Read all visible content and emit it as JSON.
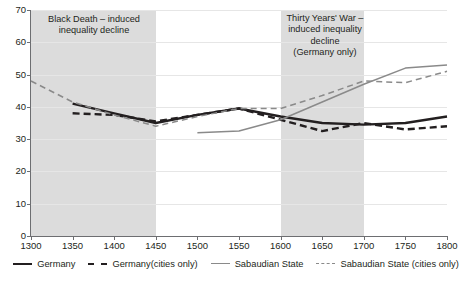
{
  "chart_data": {
    "type": "line",
    "title": "",
    "xlabel": "",
    "ylabel": "",
    "xlim": [
      1300,
      1800
    ],
    "ylim": [
      0,
      70
    ],
    "xticks": [
      1300,
      1350,
      1400,
      1450,
      1500,
      1550,
      1600,
      1650,
      1700,
      1750,
      1800
    ],
    "yticks": [
      0,
      10,
      20,
      30,
      40,
      50,
      60,
      70
    ],
    "grid": true,
    "legend_position": "bottom",
    "series": [
      {
        "name": "Germany",
        "style": "solid",
        "color": "#231f20",
        "width": 2.4,
        "x": [
          1350,
          1400,
          1450,
          1500,
          1550,
          1600,
          1650,
          1700,
          1750,
          1800
        ],
        "values": [
          41,
          38,
          35,
          37.5,
          39.5,
          37,
          35,
          34.5,
          35,
          37
        ]
      },
      {
        "name": "Germany(cities only)",
        "style": "dashed",
        "color": "#231f20",
        "width": 2.4,
        "x": [
          1350,
          1400,
          1450,
          1500,
          1550,
          1600,
          1650,
          1700,
          1750,
          1800
        ],
        "values": [
          38,
          37.5,
          35.5,
          37.5,
          39.5,
          36,
          32.5,
          35,
          33,
          34
        ]
      },
      {
        "name": "Sabaudian State",
        "style": "solid",
        "color": "#8a8a8a",
        "width": 1.5,
        "x": [
          1500,
          1550,
          1600,
          1650,
          1700,
          1750,
          1800
        ],
        "values": [
          32,
          32.5,
          36,
          41.5,
          47,
          52,
          53
        ]
      },
      {
        "name": "Sabaudian State (cities only)",
        "style": "dashed",
        "color": "#8a8a8a",
        "width": 1.5,
        "x": [
          1300,
          1350,
          1400,
          1450,
          1500,
          1550,
          1600,
          1650,
          1700,
          1750,
          1800
        ],
        "values": [
          48,
          41.5,
          37.5,
          34,
          37,
          39.5,
          39.5,
          43.5,
          48,
          47.5,
          51
        ]
      }
    ],
    "shaded_bands": [
      {
        "name": "black-death-band",
        "x0": 1300,
        "x1": 1450,
        "color": "#dcdcdc"
      },
      {
        "name": "thirty-years-war-band",
        "x0": 1600,
        "x1": 1700,
        "color": "#dcdcdc"
      }
    ],
    "annotations": [
      {
        "name": "black-death",
        "text": "Black Death – induced inequality decline"
      },
      {
        "name": "thirty-years-war",
        "text": "Thirty Years' War – induced inequality decline (Germany only)"
      }
    ]
  },
  "annotations": {
    "black_death": {
      "line1": "Black Death – induced",
      "line2": "inequality decline"
    },
    "thirty_years_war": {
      "line1": "Thirty Years' War –",
      "line2": "induced inequality",
      "line3": "decline",
      "line4": "(Germany only)"
    }
  },
  "legend": {
    "items": [
      {
        "label": "Germany"
      },
      {
        "label": "Germany(cities only)"
      },
      {
        "label": "Sabaudian State"
      },
      {
        "label": "Sabaudian State (cities only)"
      }
    ]
  }
}
